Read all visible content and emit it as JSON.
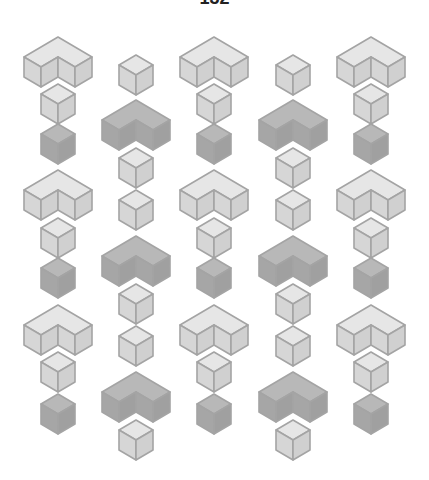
{
  "page": {
    "number": "132"
  },
  "figure": {
    "colors": {
      "light_top": "#e6e6e6",
      "light_left": "#d6d6d6",
      "light_right": "#d0d0d0",
      "dark_top": "#b8b8b8",
      "dark_left": "#a6a6a6",
      "dark_right": "#a0a0a0",
      "stroke": "#a4a4a4"
    },
    "geometry": {
      "half_width": 17,
      "rhombus_half_height": 10,
      "side_height": 20
    },
    "columns": [
      {
        "cx": 58,
        "items": [
          {
            "type": "L",
            "shade": "light",
            "top": 37
          },
          {
            "type": "cube",
            "shade": "light",
            "top": 84
          },
          {
            "type": "cube",
            "shade": "dark",
            "top": 124
          },
          {
            "type": "L",
            "shade": "light",
            "top": 170
          },
          {
            "type": "cube",
            "shade": "light",
            "top": 218
          },
          {
            "type": "cube",
            "shade": "dark",
            "top": 258
          },
          {
            "type": "L",
            "shade": "light",
            "top": 305
          },
          {
            "type": "cube",
            "shade": "light",
            "top": 352
          },
          {
            "type": "cube",
            "shade": "dark",
            "top": 394
          }
        ]
      },
      {
        "cx": 136,
        "items": [
          {
            "type": "cube",
            "shade": "light",
            "top": 55
          },
          {
            "type": "L",
            "shade": "dark",
            "top": 100
          },
          {
            "type": "cube",
            "shade": "light",
            "top": 148
          },
          {
            "type": "cube",
            "shade": "light",
            "top": 190
          },
          {
            "type": "L",
            "shade": "dark",
            "top": 236
          },
          {
            "type": "cube",
            "shade": "light",
            "top": 284
          },
          {
            "type": "cube",
            "shade": "light",
            "top": 326
          },
          {
            "type": "L",
            "shade": "dark",
            "top": 372
          },
          {
            "type": "cube",
            "shade": "light",
            "top": 420
          }
        ]
      },
      {
        "cx": 214,
        "items": [
          {
            "type": "L",
            "shade": "light",
            "top": 37
          },
          {
            "type": "cube",
            "shade": "light",
            "top": 84
          },
          {
            "type": "cube",
            "shade": "dark",
            "top": 124
          },
          {
            "type": "L",
            "shade": "light",
            "top": 170
          },
          {
            "type": "cube",
            "shade": "light",
            "top": 218
          },
          {
            "type": "cube",
            "shade": "dark",
            "top": 258
          },
          {
            "type": "L",
            "shade": "light",
            "top": 305
          },
          {
            "type": "cube",
            "shade": "light",
            "top": 352
          },
          {
            "type": "cube",
            "shade": "dark",
            "top": 394
          }
        ]
      },
      {
        "cx": 293,
        "items": [
          {
            "type": "cube",
            "shade": "light",
            "top": 55
          },
          {
            "type": "L",
            "shade": "dark",
            "top": 100
          },
          {
            "type": "cube",
            "shade": "light",
            "top": 148
          },
          {
            "type": "cube",
            "shade": "light",
            "top": 190
          },
          {
            "type": "L",
            "shade": "dark",
            "top": 236
          },
          {
            "type": "cube",
            "shade": "light",
            "top": 284
          },
          {
            "type": "cube",
            "shade": "light",
            "top": 326
          },
          {
            "type": "L",
            "shade": "dark",
            "top": 372
          },
          {
            "type": "cube",
            "shade": "light",
            "top": 420
          }
        ]
      },
      {
        "cx": 371,
        "items": [
          {
            "type": "L",
            "shade": "light",
            "top": 37
          },
          {
            "type": "cube",
            "shade": "light",
            "top": 84
          },
          {
            "type": "cube",
            "shade": "dark",
            "top": 124
          },
          {
            "type": "L",
            "shade": "light",
            "top": 170
          },
          {
            "type": "cube",
            "shade": "light",
            "top": 218
          },
          {
            "type": "cube",
            "shade": "dark",
            "top": 258
          },
          {
            "type": "L",
            "shade": "light",
            "top": 305
          },
          {
            "type": "cube",
            "shade": "light",
            "top": 352
          },
          {
            "type": "cube",
            "shade": "dark",
            "top": 394
          }
        ]
      }
    ]
  }
}
